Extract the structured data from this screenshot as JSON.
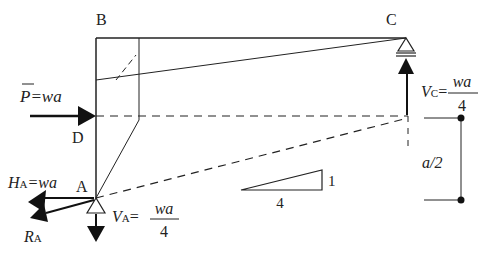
{
  "diagram": {
    "type": "structural-frame-free-body",
    "points": {
      "A": "A",
      "B": "B",
      "C": "C",
      "D": "D"
    },
    "load": {
      "symbol": "P",
      "equals": "=wa"
    },
    "reactions": {
      "HA": {
        "symbol": "H",
        "sub": "A",
        "equals": "=wa"
      },
      "RA": {
        "symbol": "R",
        "sub": "A"
      },
      "VA": {
        "symbol": "V",
        "sub": "A",
        "equals": "=",
        "num": "wa",
        "den": "4"
      },
      "VC": {
        "symbol": "V",
        "sub": "C",
        "equals": "=",
        "num": "wa",
        "den": "4"
      }
    },
    "slope": {
      "rise": "1",
      "run": "4"
    },
    "dimension": {
      "label": "a/2"
    }
  }
}
